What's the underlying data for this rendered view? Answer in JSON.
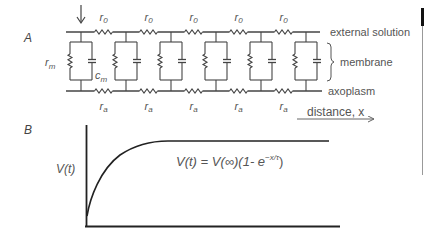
{
  "panels": {
    "a": {
      "label": "A",
      "circuit": {
        "segment_count": 6,
        "top_resistor_label": "r",
        "top_resistor_sub": "0",
        "bottom_resistor_label": "r",
        "bottom_resistor_sub": "a",
        "membrane_resistor_label": "r",
        "membrane_resistor_sub": "m",
        "membrane_capacitor_label": "c",
        "membrane_capacitor_sub": "m",
        "current_injection": "down-arrow-icon"
      },
      "annotations": {
        "external_solution": "external solution",
        "membrane": "membrane",
        "axoplasm": "axoplasm",
        "distance": "distance, x"
      }
    },
    "b": {
      "label": "B",
      "y_axis_label": "V(t)",
      "equation": "V(t) = V(∞)(1- e",
      "equation_exponent": "−x/τ",
      "equation_close": ")"
    }
  },
  "chart_data": {
    "type": "line",
    "title": "",
    "xlabel": "",
    "ylabel": "V(t)",
    "annotation": "V(t) = V(∞)(1- e^(−x/τ))",
    "series": [
      {
        "name": "V(t)",
        "function": "exponential rise to plateau",
        "x": [
          0,
          0.1,
          0.2,
          0.3,
          0.4,
          0.5,
          0.6,
          1.0
        ],
        "y": [
          0,
          0.45,
          0.7,
          0.84,
          0.93,
          0.97,
          1.0,
          1.0
        ]
      }
    ],
    "grid": false,
    "legend": "none"
  },
  "colors": {
    "line": "#333333",
    "text": "#555555"
  }
}
